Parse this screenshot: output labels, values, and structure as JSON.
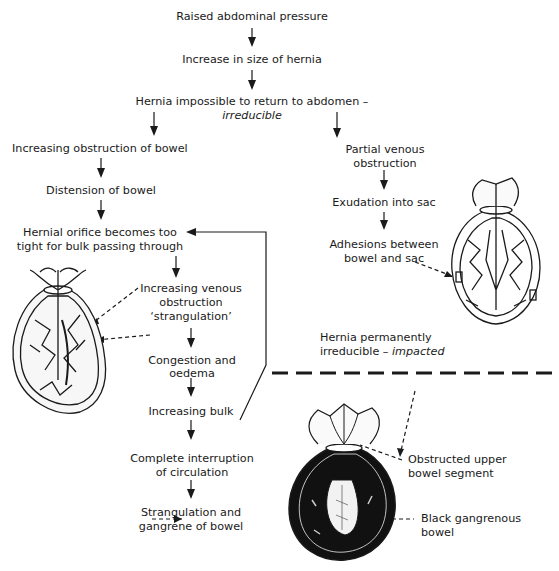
{
  "diagram": {
    "nodes": {
      "raised_pressure": "Raised abdominal pressure",
      "increase_size": "Increase in size of hernia",
      "irreducible_line1": "Hernia impossible to return to abdomen –",
      "irreducible_line2": "irreducible",
      "obstruction_bowel": "Increasing obstruction of bowel",
      "distension": "Distension of bowel",
      "orifice_line1": "Hernial orifice becomes too",
      "orifice_line2": "tight for bulk passing through",
      "venous_line1": "Increasing venous",
      "venous_line2": "obstruction",
      "venous_line3": "‘strangulation’",
      "congestion_line1": "Congestion and",
      "congestion_line2": "oedema",
      "bulk": "Increasing bulk",
      "interruption_line1": "Complete interruption",
      "interruption_line2": "of circulation",
      "strangulation_line1": "Strangulation and",
      "strangulation_line2": "gangrene of bowel",
      "partial_line1": "Partial venous",
      "partial_line2": "obstruction",
      "exudation": "Exudation into sac",
      "adhesions_line1": "Adhesions between",
      "adhesions_line2": "bowel and sac",
      "impacted_line1": "Hernia permanently",
      "impacted_line2a": "irreducible – ",
      "impacted_line2b": "impacted",
      "upper_segment_line1": "Obstructed upper",
      "upper_segment_line2": "bowel segment",
      "gangrenous_line1": "Black gangrenous",
      "gangrenous_line2": "bowel"
    },
    "illustrations": [
      "strangulated-hernia-sac",
      "adhesions-hernia-sac",
      "gangrenous-hernia-sac"
    ],
    "colors": {
      "ink": "#1a1a1a",
      "background": "#ffffff"
    }
  }
}
